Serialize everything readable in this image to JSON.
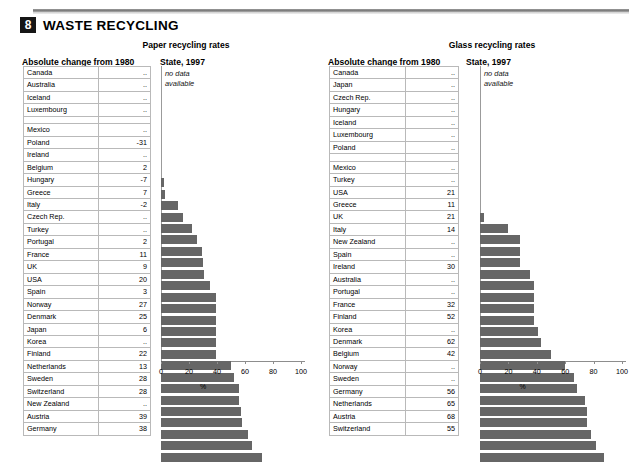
{
  "header": {
    "chapter_number": "8",
    "title": "WASTE RECYCLING"
  },
  "panels": [
    {
      "id": "paper",
      "title": "Paper recycling rates",
      "table_heading": "Absolute change from 1980",
      "chart_heading": "State, 1997",
      "no_data_note": "no data\navailable",
      "no_data_line1": "no data",
      "no_data_line2": "available",
      "axis_unit": "%",
      "rows": [
        {
          "name": "Canada",
          "change": "..",
          "rate": null
        },
        {
          "name": "Australia",
          "change": "..",
          "rate": null
        },
        {
          "name": "Iceland",
          "change": "..",
          "rate": null
        },
        {
          "name": "Luxembourg",
          "change": "..",
          "rate": null
        },
        {
          "name": "",
          "change": "",
          "rate": null,
          "spacer": true
        },
        {
          "name": "Mexico",
          "change": "..",
          "rate": 2
        },
        {
          "name": "Poland",
          "change": "-31",
          "rate": 3
        },
        {
          "name": "Ireland",
          "change": "..",
          "rate": 12
        },
        {
          "name": "Belgium",
          "change": "2",
          "rate": 16
        },
        {
          "name": "Hungary",
          "change": "-7",
          "rate": 22
        },
        {
          "name": "Greece",
          "change": "7",
          "rate": 26
        },
        {
          "name": "Italy",
          "change": "-2",
          "rate": 29
        },
        {
          "name": "Czech Rep.",
          "change": "..",
          "rate": 30
        },
        {
          "name": "Turkey",
          "change": "..",
          "rate": 31
        },
        {
          "name": "Portugal",
          "change": "2",
          "rate": 35
        },
        {
          "name": "France",
          "change": "11",
          "rate": 39
        },
        {
          "name": "UK",
          "change": "9",
          "rate": 39
        },
        {
          "name": "USA",
          "change": "20",
          "rate": 39
        },
        {
          "name": "Spain",
          "change": "3",
          "rate": 39
        },
        {
          "name": "Norway",
          "change": "27",
          "rate": 39
        },
        {
          "name": "Denmark",
          "change": "25",
          "rate": 39
        },
        {
          "name": "Japan",
          "change": "6",
          "rate": 50
        },
        {
          "name": "Korea",
          "change": "..",
          "rate": 52
        },
        {
          "name": "Finland",
          "change": "22",
          "rate": 56
        },
        {
          "name": "Netherlands",
          "change": "13",
          "rate": 56
        },
        {
          "name": "Sweden",
          "change": "28",
          "rate": 57
        },
        {
          "name": "Switzerland",
          "change": "28",
          "rate": 58
        },
        {
          "name": "New Zealand",
          "change": "..",
          "rate": 62
        },
        {
          "name": "Austria",
          "change": "39",
          "rate": 65
        },
        {
          "name": "Germany",
          "change": "38",
          "rate": 72
        }
      ]
    },
    {
      "id": "glass",
      "title": "Glass recycling rates",
      "table_heading": "Absolute change from 1980",
      "chart_heading": "State, 1997",
      "no_data_note": "no data\navailable",
      "no_data_line1": "no data",
      "no_data_line2": "available",
      "axis_unit": "%",
      "rows": [
        {
          "name": "Canada",
          "change": "..",
          "rate": null
        },
        {
          "name": "Japan",
          "change": "..",
          "rate": null
        },
        {
          "name": "Czech Rep.",
          "change": "..",
          "rate": null
        },
        {
          "name": "Hungary",
          "change": "..",
          "rate": null
        },
        {
          "name": "Iceland",
          "change": "..",
          "rate": null
        },
        {
          "name": "Luxembourg",
          "change": "..",
          "rate": null
        },
        {
          "name": "Poland",
          "change": "..",
          "rate": null
        },
        {
          "name": "",
          "change": "",
          "rate": null,
          "spacer": true
        },
        {
          "name": "Mexico",
          "change": "..",
          "rate": 3
        },
        {
          "name": "Turkey",
          "change": "..",
          "rate": 20
        },
        {
          "name": "USA",
          "change": "21",
          "rate": 28
        },
        {
          "name": "Greece",
          "change": "11",
          "rate": 28
        },
        {
          "name": "UK",
          "change": "21",
          "rate": 28
        },
        {
          "name": "Italy",
          "change": "14",
          "rate": 35
        },
        {
          "name": "New Zealand",
          "change": "..",
          "rate": 38
        },
        {
          "name": "Spain",
          "change": "..",
          "rate": 38
        },
        {
          "name": "Ireland",
          "change": "30",
          "rate": 38
        },
        {
          "name": "Australia",
          "change": "..",
          "rate": 38
        },
        {
          "name": "Portugal",
          "change": "..",
          "rate": 41
        },
        {
          "name": "France",
          "change": "32",
          "rate": 43
        },
        {
          "name": "Finland",
          "change": "52",
          "rate": 50
        },
        {
          "name": "Korea",
          "change": "..",
          "rate": 60
        },
        {
          "name": "Denmark",
          "change": "62",
          "rate": 66
        },
        {
          "name": "Belgium",
          "change": "42",
          "rate": 68
        },
        {
          "name": "Norway",
          "change": "..",
          "rate": 74
        },
        {
          "name": "Sweden",
          "change": "..",
          "rate": 75
        },
        {
          "name": "Germany",
          "change": "56",
          "rate": 75
        },
        {
          "name": "Netherlands",
          "change": "65",
          "rate": 78
        },
        {
          "name": "Austria",
          "change": "68",
          "rate": 82
        },
        {
          "name": "Switzerland",
          "change": "55",
          "rate": 87
        }
      ]
    }
  ],
  "axis": {
    "ticks": [
      0,
      20,
      40,
      60,
      80,
      100
    ],
    "min": 0,
    "max": 100
  },
  "colors": {
    "bar": "#666666",
    "grid": "#b9b9b9",
    "chapter_badge": "#161616"
  },
  "chart_data": [
    {
      "type": "bar",
      "title": "Paper recycling rates — State, 1997",
      "xlabel": "%",
      "ylabel": "",
      "xlim": [
        0,
        100
      ],
      "orientation": "horizontal",
      "grid": false,
      "legend": "none",
      "categories": [
        "Canada",
        "Australia",
        "Iceland",
        "Luxembourg",
        "Mexico",
        "Poland",
        "Ireland",
        "Belgium",
        "Hungary",
        "Greece",
        "Italy",
        "Czech Rep.",
        "Turkey",
        "Portugal",
        "France",
        "UK",
        "USA",
        "Spain",
        "Norway",
        "Denmark",
        "Japan",
        "Korea",
        "Finland",
        "Netherlands",
        "Sweden",
        "Switzerland",
        "New Zealand",
        "Austria",
        "Germany"
      ],
      "values": [
        null,
        null,
        null,
        null,
        2,
        3,
        12,
        16,
        22,
        26,
        29,
        30,
        31,
        35,
        39,
        39,
        39,
        39,
        39,
        39,
        50,
        52,
        56,
        56,
        57,
        58,
        62,
        65,
        72
      ],
      "annotations": [
        "no data available"
      ]
    },
    {
      "type": "bar",
      "title": "Paper recycling — Absolute change from 1980",
      "xlabel": "",
      "ylabel": "",
      "orientation": "table",
      "categories": [
        "Canada",
        "Australia",
        "Iceland",
        "Luxembourg",
        "Mexico",
        "Poland",
        "Ireland",
        "Belgium",
        "Hungary",
        "Greece",
        "Italy",
        "Czech Rep.",
        "Turkey",
        "Portugal",
        "France",
        "UK",
        "USA",
        "Spain",
        "Norway",
        "Denmark",
        "Japan",
        "Korea",
        "Finland",
        "Netherlands",
        "Sweden",
        "Switzerland",
        "New Zealand",
        "Austria",
        "Germany"
      ],
      "values": [
        null,
        null,
        null,
        null,
        null,
        -31,
        null,
        2,
        -7,
        7,
        -2,
        null,
        null,
        2,
        11,
        9,
        20,
        3,
        27,
        25,
        6,
        null,
        22,
        13,
        28,
        28,
        null,
        39,
        38
      ]
    },
    {
      "type": "bar",
      "title": "Glass recycling rates — State, 1997",
      "xlabel": "%",
      "ylabel": "",
      "xlim": [
        0,
        100
      ],
      "orientation": "horizontal",
      "grid": false,
      "legend": "none",
      "categories": [
        "Canada",
        "Japan",
        "Czech Rep.",
        "Hungary",
        "Iceland",
        "Luxembourg",
        "Poland",
        "Mexico",
        "Turkey",
        "USA",
        "Greece",
        "UK",
        "Italy",
        "New Zealand",
        "Spain",
        "Ireland",
        "Australia",
        "Portugal",
        "France",
        "Finland",
        "Korea",
        "Denmark",
        "Belgium",
        "Norway",
        "Sweden",
        "Germany",
        "Netherlands",
        "Austria",
        "Switzerland"
      ],
      "values": [
        null,
        null,
        null,
        null,
        null,
        null,
        null,
        3,
        20,
        28,
        28,
        28,
        35,
        38,
        38,
        38,
        38,
        41,
        43,
        50,
        60,
        66,
        68,
        74,
        75,
        75,
        78,
        82,
        87
      ],
      "annotations": [
        "no data available"
      ]
    },
    {
      "type": "bar",
      "title": "Glass recycling — Absolute change from 1980",
      "xlabel": "",
      "ylabel": "",
      "orientation": "table",
      "categories": [
        "Canada",
        "Japan",
        "Czech Rep.",
        "Hungary",
        "Iceland",
        "Luxembourg",
        "Poland",
        "Mexico",
        "Turkey",
        "USA",
        "Greece",
        "UK",
        "Italy",
        "New Zealand",
        "Spain",
        "Ireland",
        "Australia",
        "Portugal",
        "France",
        "Finland",
        "Korea",
        "Denmark",
        "Belgium",
        "Norway",
        "Sweden",
        "Germany",
        "Netherlands",
        "Austria",
        "Switzerland"
      ],
      "values": [
        null,
        null,
        null,
        null,
        null,
        null,
        null,
        null,
        null,
        21,
        11,
        21,
        14,
        null,
        null,
        30,
        null,
        null,
        32,
        52,
        null,
        62,
        42,
        null,
        null,
        56,
        65,
        68,
        55
      ]
    }
  ]
}
